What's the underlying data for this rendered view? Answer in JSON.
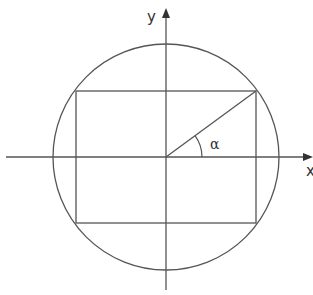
{
  "diagram": {
    "title": "",
    "colors": {
      "stroke": "#555555",
      "background": "#ffffff",
      "text": "#333333"
    },
    "axes": {
      "x_label": "x",
      "y_label": "y"
    },
    "angle_label": "α",
    "elements": [
      {
        "type": "circle",
        "label": "circle centered at origin"
      },
      {
        "type": "rectangle",
        "label": "rectangle inscribed in circle"
      },
      {
        "type": "segment",
        "label": "radius from origin to top-right corner"
      },
      {
        "type": "arc",
        "label": "angle alpha between x-axis and radius"
      }
    ]
  }
}
